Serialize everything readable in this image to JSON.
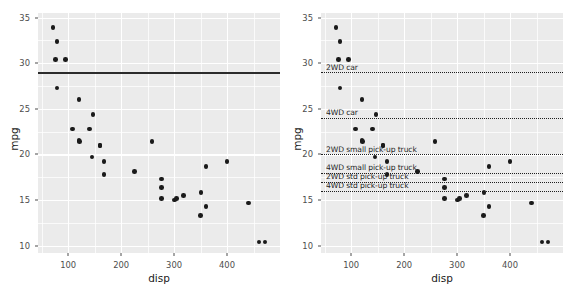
{
  "figure": {
    "title": "",
    "panel_count": 2
  },
  "axes": {
    "xlabel": "disp",
    "ylabel": "mpg",
    "xticks": [
      100,
      200,
      300,
      400
    ],
    "yticks": [
      10,
      15,
      20,
      25,
      30,
      35
    ],
    "xlim": [
      43,
      500
    ],
    "ylim": [
      9.2,
      35.5
    ],
    "x_minor": [
      50,
      150,
      250,
      350,
      450
    ],
    "y_minor": [
      12.5,
      17.5,
      22.5,
      27.5,
      32.5
    ],
    "grid": "on",
    "panel_background": "#ebebeb",
    "grid_color": "#ffffff"
  },
  "chart_data": [
    {
      "type": "scatter",
      "panel": "left",
      "title": "",
      "xlabel": "disp",
      "ylabel": "mpg",
      "xlim": [
        43,
        500
      ],
      "ylim": [
        9.2,
        35.5
      ],
      "grid": "on",
      "point_color": "#1a1a1a",
      "x": [
        160,
        160,
        108,
        258,
        360,
        225,
        360,
        146.7,
        140.8,
        167.6,
        167.6,
        275.8,
        275.8,
        275.8,
        472,
        460,
        440,
        78.7,
        75.7,
        71.1,
        120.1,
        318,
        304,
        350,
        400,
        79,
        120.3,
        95.1,
        351,
        145,
        301,
        121
      ],
      "y": [
        21,
        21,
        22.8,
        21.4,
        18.7,
        18.1,
        14.3,
        24.4,
        22.8,
        19.2,
        17.8,
        16.4,
        17.3,
        15.2,
        10.4,
        10.4,
        14.7,
        32.4,
        30.4,
        33.9,
        21.5,
        15.5,
        15.2,
        13.3,
        19.2,
        27.3,
        26,
        30.4,
        15.8,
        19.7,
        15,
        21.4
      ],
      "reference_lines": [
        {
          "y": 29,
          "style": "solid",
          "label": "",
          "color": "#2b2b2b"
        }
      ]
    },
    {
      "type": "scatter",
      "panel": "right",
      "title": "",
      "xlabel": "disp",
      "ylabel": "mpg",
      "xlim": [
        43,
        500
      ],
      "ylim": [
        9.2,
        35.5
      ],
      "grid": "on",
      "point_color": "#1a1a1a",
      "x": [
        160,
        160,
        108,
        258,
        360,
        225,
        360,
        146.7,
        140.8,
        167.6,
        167.6,
        275.8,
        275.8,
        275.8,
        472,
        460,
        440,
        78.7,
        75.7,
        71.1,
        120.1,
        318,
        304,
        350,
        400,
        79,
        120.3,
        95.1,
        351,
        145,
        301,
        121
      ],
      "y": [
        21,
        21,
        22.8,
        21.4,
        18.7,
        18.1,
        14.3,
        24.4,
        22.8,
        19.2,
        17.8,
        16.4,
        17.3,
        15.2,
        10.4,
        10.4,
        14.7,
        32.4,
        30.4,
        33.9,
        21.5,
        15.5,
        15.2,
        13.3,
        19.2,
        27.3,
        26,
        30.4,
        15.8,
        19.7,
        15,
        21.4
      ],
      "reference_lines": [
        {
          "y": 29,
          "style": "dotted",
          "label": "2WD car",
          "color": "#1f1f1f"
        },
        {
          "y": 24,
          "style": "dotted",
          "label": "4WD car",
          "color": "#1f1f1f"
        },
        {
          "y": 20,
          "style": "dotted",
          "label": "2WD small pick-up truck",
          "color": "#1f1f1f"
        },
        {
          "y": 18,
          "style": "dotted",
          "label": "4WD small pick-up truck",
          "color": "#1f1f1f"
        },
        {
          "y": 17,
          "style": "dotted",
          "label": "2WD std pick-up truck",
          "color": "#1f1f1f"
        },
        {
          "y": 16,
          "style": "dotted",
          "label": "4WD std pick-up truck",
          "color": "#1f1f1f"
        }
      ]
    }
  ]
}
